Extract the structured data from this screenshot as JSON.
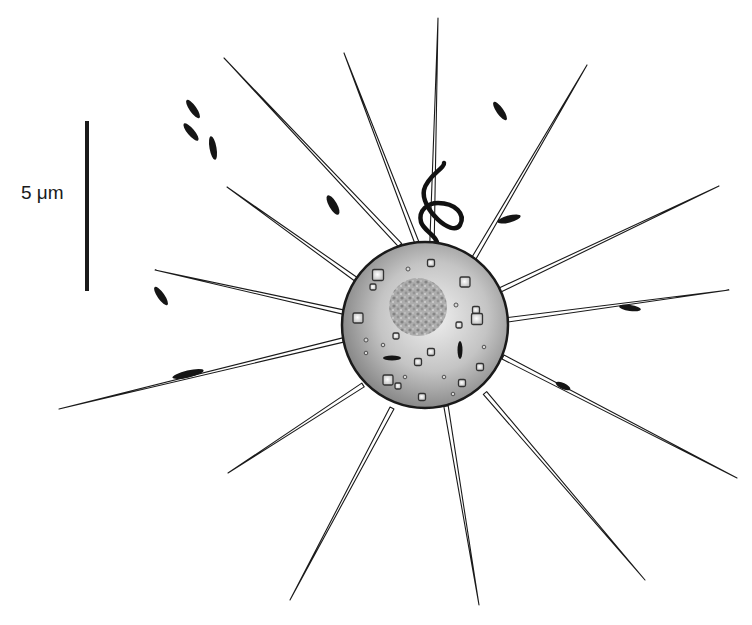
{
  "figure": {
    "type": "schematic illustration of a spherical cell with radiating spines",
    "scale_bar": {
      "label": "5 μm",
      "length_px": 170
    },
    "colors": {
      "background": "#ffffff",
      "outline": "#1a1a1a",
      "cell_fill_light": "#e4e4e4",
      "cell_fill_dark": "#8a8a8a",
      "nucleus": "#9a9a9a"
    },
    "cell": {
      "cx": 425,
      "cy": 325,
      "r": 83
    },
    "nucleus": {
      "cx": 418,
      "cy": 307,
      "r": 29
    },
    "flagellum": {
      "description": "S-shaped looping flagellum emerging from top of cell"
    },
    "spines": [
      {
        "x1": 400,
        "y1": 245,
        "x2": 224,
        "y2": 58
      },
      {
        "x1": 417,
        "y1": 243,
        "x2": 344,
        "y2": 53
      },
      {
        "x1": 432,
        "y1": 243,
        "x2": 438,
        "y2": 18
      },
      {
        "x1": 474,
        "y1": 258,
        "x2": 587,
        "y2": 65
      },
      {
        "x1": 500,
        "y1": 290,
        "x2": 719,
        "y2": 186
      },
      {
        "x1": 506,
        "y1": 320,
        "x2": 729,
        "y2": 290
      },
      {
        "x1": 503,
        "y1": 357,
        "x2": 737,
        "y2": 478
      },
      {
        "x1": 485,
        "y1": 393,
        "x2": 645,
        "y2": 580
      },
      {
        "x1": 446,
        "y1": 406,
        "x2": 479,
        "y2": 605
      },
      {
        "x1": 392,
        "y1": 408,
        "x2": 290,
        "y2": 600
      },
      {
        "x1": 363,
        "y1": 385,
        "x2": 228,
        "y2": 473
      },
      {
        "x1": 343,
        "y1": 340,
        "x2": 59,
        "y2": 409
      },
      {
        "x1": 343,
        "y1": 312,
        "x2": 155,
        "y2": 270
      },
      {
        "x1": 357,
        "y1": 280,
        "x2": 227,
        "y2": 187
      }
    ],
    "free_rods": [
      {
        "cx": 193,
        "cy": 109,
        "rx": 11,
        "ry": 3.5,
        "angle": 55
      },
      {
        "cx": 191,
        "cy": 132,
        "rx": 11,
        "ry": 3.5,
        "angle": 50
      },
      {
        "cx": 213,
        "cy": 148,
        "rx": 12,
        "ry": 3.5,
        "angle": 80
      },
      {
        "cx": 500,
        "cy": 111,
        "rx": 11,
        "ry": 3.5,
        "angle": 55
      },
      {
        "cx": 161,
        "cy": 296,
        "rx": 11,
        "ry": 3.5,
        "angle": 55
      }
    ],
    "attached_rods": [
      {
        "cx": 333,
        "cy": 205,
        "rx": 11,
        "ry": 4,
        "angle": 60
      },
      {
        "cx": 509,
        "cy": 219,
        "rx": 12,
        "ry": 3.5,
        "angle": -15
      },
      {
        "cx": 630,
        "cy": 308,
        "rx": 11,
        "ry": 3,
        "angle": 8
      },
      {
        "cx": 563,
        "cy": 386,
        "rx": 8,
        "ry": 3,
        "angle": 25
      },
      {
        "cx": 188,
        "cy": 374,
        "rx": 16,
        "ry": 3.5,
        "angle": -13
      }
    ],
    "inner_rods": [
      {
        "cx": 392,
        "cy": 358,
        "rx": 9,
        "ry": 2.5,
        "angle": 0
      },
      {
        "cx": 460,
        "cy": 350,
        "rx": 2.5,
        "ry": 9,
        "angle": 0
      }
    ],
    "vesicles": [
      {
        "x": 378,
        "y": 275,
        "s": 11
      },
      {
        "x": 373,
        "y": 287,
        "s": 6
      },
      {
        "x": 465,
        "y": 282,
        "s": 10
      },
      {
        "x": 431,
        "y": 263,
        "s": 7
      },
      {
        "x": 358,
        "y": 318,
        "s": 10
      },
      {
        "x": 476,
        "y": 310,
        "s": 7
      },
      {
        "x": 477,
        "y": 319,
        "s": 11
      },
      {
        "x": 459,
        "y": 325,
        "s": 6
      },
      {
        "x": 396,
        "y": 336,
        "s": 6
      },
      {
        "x": 431,
        "y": 352,
        "s": 7
      },
      {
        "x": 418,
        "y": 362,
        "s": 7
      },
      {
        "x": 480,
        "y": 367,
        "s": 7
      },
      {
        "x": 388,
        "y": 380,
        "s": 10
      },
      {
        "x": 398,
        "y": 386,
        "s": 6
      },
      {
        "x": 462,
        "y": 383,
        "s": 7
      },
      {
        "x": 422,
        "y": 397,
        "s": 7
      }
    ],
    "granules": [
      {
        "cx": 408,
        "cy": 269,
        "r": 2
      },
      {
        "cx": 456,
        "cy": 305,
        "r": 2
      },
      {
        "cx": 366,
        "cy": 340,
        "r": 2
      },
      {
        "cx": 383,
        "cy": 345,
        "r": 1.8
      },
      {
        "cx": 366,
        "cy": 353,
        "r": 1.8
      },
      {
        "cx": 484,
        "cy": 347,
        "r": 1.8
      },
      {
        "cx": 444,
        "cy": 377,
        "r": 1.8
      },
      {
        "cx": 405,
        "cy": 377,
        "r": 1.8
      },
      {
        "cx": 453,
        "cy": 394,
        "r": 1.8
      }
    ]
  }
}
